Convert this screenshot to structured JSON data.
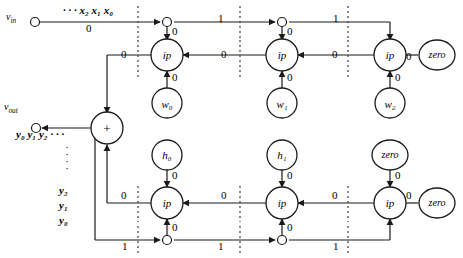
{
  "diagram": {
    "terminals": {
      "input_label": "v",
      "input_sub": "in",
      "output_label": "v",
      "output_sub": "out"
    },
    "sequences": {
      "input_stream": "· · · x₂ x₁ x₀",
      "output_stream": "y₀ y₁ y₂ · · ·",
      "input_stream_delay": "0",
      "feedback_items": [
        "y₂",
        "y₁",
        "y₀"
      ],
      "feedback_dots": "·"
    },
    "nodes": {
      "top_ip": [
        "ip",
        "ip",
        "ip"
      ],
      "bottom_ip": [
        "ip",
        "ip",
        "ip"
      ],
      "weights": [
        "w₀",
        "w₁",
        "w₂"
      ],
      "coefficients": [
        "h₀",
        "h₁"
      ],
      "zeros": [
        "zero",
        "zero",
        "zero"
      ],
      "adder": "+"
    },
    "edge_labels": {
      "top_rail": [
        "1",
        "1"
      ],
      "top_junction_down": [
        "0",
        "0"
      ],
      "top_ip_chain": [
        "0",
        "0",
        "0"
      ],
      "top_zero_in": "0",
      "weight_up": [
        "0",
        "0",
        "0"
      ],
      "adder_in_top": "0",
      "adder_in_bottom": "0",
      "coefficient_down": [
        "0",
        "0"
      ],
      "bottom_zero_down": "0",
      "bottom_zero_side": "0",
      "bottom_ip_chain": [
        "0",
        "0",
        "0"
      ],
      "bottom_junction_up": [
        "0",
        "0"
      ],
      "bottom_rail": [
        "1",
        "1",
        "1"
      ]
    },
    "colors": {
      "stroke": "#1a1a1a",
      "background": "#ffffff",
      "dotted_divider": "#4a4a4a"
    }
  }
}
